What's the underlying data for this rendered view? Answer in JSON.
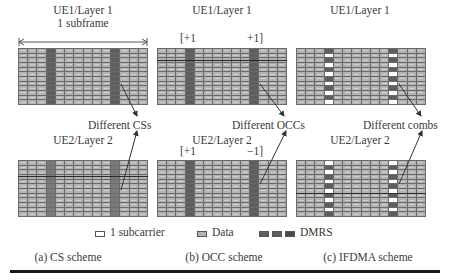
{
  "panels": [
    {
      "id": "a",
      "ue1_title": "UE1/Layer 1",
      "subframe_label": "1 subframe",
      "difference_label": "Different CSs",
      "ue2_title": "UE2/Layer 2",
      "caption": "(a) CS scheme"
    },
    {
      "id": "b",
      "ue1_title": "UE1/Layer 1",
      "ue1_occ_left": "[+1",
      "ue1_occ_right": "+1]",
      "difference_label": "Different OCCs",
      "ue2_title": "UE2/Layer 2",
      "ue2_occ_left": "[+1",
      "ue2_occ_right": "−1]",
      "caption": "(b) OCC scheme"
    },
    {
      "id": "c",
      "ue1_title": "UE1/Layer 1",
      "difference_label": "Different combs",
      "ue2_title": "UE2/Layer 2",
      "caption": "(c) IFDMA scheme"
    }
  ],
  "grid": {
    "columns": 14,
    "rows": 12,
    "dmrs_columns": [
      3,
      10
    ]
  },
  "legend": {
    "subcarrier": "1 subcarrier",
    "data": "Data",
    "dmrs": "DMRS"
  },
  "colors": {
    "data_cell": "#b3b3b3",
    "dmrs_cell": "#5e5e5e",
    "grid_line": "#6a6a6a",
    "text": "#3a3a3a"
  }
}
